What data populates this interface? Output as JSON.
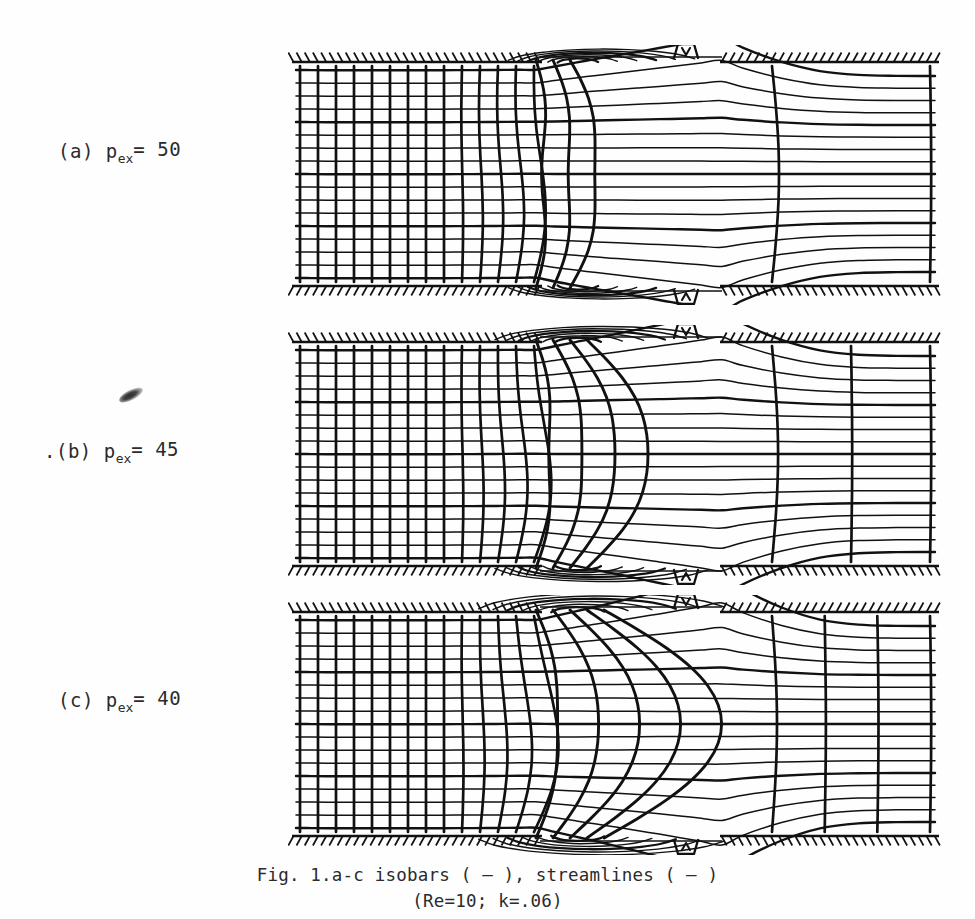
{
  "figure": {
    "title_caption_line1": "Fig. 1.a-c  isobars ( – ), streamlines ( – )",
    "title_caption_line2": "(Re=10; k=.06)",
    "ink_color": "#111111",
    "paper_color": "#fefefe"
  },
  "panels": [
    {
      "id": "a",
      "label_prefix": "(a)  p",
      "label_sub": "ex",
      "label_value": "= 50",
      "p_ex": 50
    },
    {
      "id": "b",
      "label_prefix": ".(b)  p",
      "label_sub": "ex",
      "label_value": "= 45",
      "p_ex": 45
    },
    {
      "id": "c",
      "label_prefix": "(c)  p",
      "label_sub": "ex",
      "label_value": "= 40",
      "p_ex": 40
    }
  ],
  "chart_data": {
    "type": "line",
    "title": "Fig. 1.a-c  isobars ( – ), streamlines ( – )",
    "subtitle": "(Re=10; k=.06)",
    "legend": [
      "isobars ( – )",
      "streamlines ( – )"
    ],
    "parameters": {
      "Re": 10,
      "k": 0.06
    },
    "xlabel": "",
    "ylabel": "",
    "grid": false,
    "geometry": {
      "description": "channel with sudden expansion at x=540 and re-contraction at x=722",
      "inlet_x_range": [
        296,
        540
      ],
      "expansion_x_range": [
        540,
        722
      ],
      "outlet_x_range": [
        722,
        935
      ],
      "inlet_wall_top_y": 62,
      "inlet_wall_bottom_y": 286,
      "expansion_wall_top_y": 57,
      "expansion_wall_bottom_y": 291,
      "outlet_wall_top_y": 62,
      "outlet_wall_bottom_y": 286
    },
    "series": [
      {
        "name": "isobars",
        "kind": "vertical-contours",
        "inlet_count": 14,
        "inlet_spacing_px": 18,
        "panel_outlet_counts": {
          "a": 2,
          "b": 3,
          "c": 4
        }
      },
      {
        "name": "streamlines",
        "kind": "horizontal-contours",
        "inlet_count": 17,
        "inlet_spacing_px": 12.8,
        "outlet_count_a": 4,
        "outlet_count_b": 6,
        "outlet_count_c": 6
      }
    ],
    "annotations": [
      "recirculation eddy upper corner after expansion",
      "recirculation eddy lower corner after expansion",
      "small closed contour pockets near re-contraction corners"
    ]
  }
}
